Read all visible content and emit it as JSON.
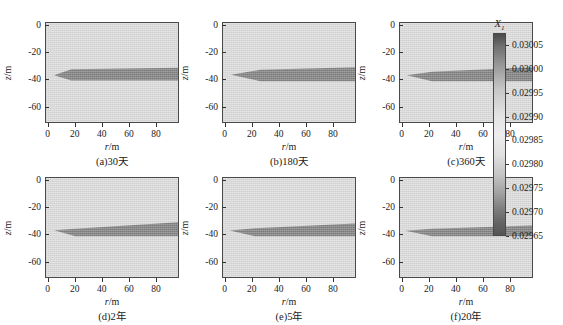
{
  "figure": {
    "background": "#ffffff",
    "panel_fill_color": "#dcdcdc",
    "plume_color": "#808080",
    "axis_color": "#4a4a4a"
  },
  "axes": {
    "x_title_var": "r",
    "x_title_unit": "/m",
    "y_title_var": "z",
    "y_title_unit": "/m",
    "x_ticks": [
      "0",
      "20",
      "40",
      "60",
      "80"
    ],
    "x_tick_values": [
      0,
      20,
      40,
      60,
      80
    ],
    "x_range": [
      -2,
      97
    ],
    "y_ticks": [
      "0",
      "-20",
      "-40",
      "-60"
    ],
    "y_tick_values": [
      0,
      -20,
      -40,
      -60
    ],
    "y_range": [
      -72,
      2
    ]
  },
  "colorbar": {
    "title_var": "X",
    "title_sub": "1",
    "labels": [
      "0.03005",
      "0.03000",
      "0.02995",
      "0.02990",
      "0.02985",
      "0.02980",
      "0.02975",
      "0.02970",
      "0.02965"
    ],
    "values": [
      0.03005,
      0.03,
      0.02995,
      0.0299,
      0.02985,
      0.0298,
      0.02975,
      0.0297,
      0.02965
    ],
    "vmin": 0.02965,
    "vmax": 0.030075,
    "orientation": "vertical"
  },
  "chart_data": {
    "type": "heatmap",
    "title": "",
    "xlabel": "r/m",
    "ylabel": "z/m",
    "colorbar_label": "X1",
    "xlim": [
      -2,
      97
    ],
    "ylim": [
      -72,
      2
    ],
    "grid": false,
    "legend": "colorbar-right",
    "panels": [
      {
        "id": "a",
        "caption": "(a)30天",
        "time_label": "30天",
        "row": 0,
        "col": 0,
        "plume_top_r0": -35.5,
        "plume_bottom_r0": -38.5,
        "plume_top_rmax": -31.5,
        "plume_bottom_rmax": -41.0,
        "nose_r": 4,
        "shoulder_r": 17,
        "shoulder_top": -32.5,
        "shoulder_bottom": -41.0,
        "description": "blunt-nosed slab, nearly constant thickness beyond r=20"
      },
      {
        "id": "b",
        "caption": "(b)180天",
        "time_label": "180天",
        "row": 0,
        "col": 1,
        "plume_top_r0": -35.5,
        "plume_bottom_r0": -38.0,
        "plume_top_rmax": -31.0,
        "plume_bottom_rmax": -41.5,
        "nose_r": 4,
        "shoulder_r": 26,
        "shoulder_top": -33.0,
        "shoulder_bottom": -41.5,
        "description": "tapered wedge thickening to r=26 then flat slab"
      },
      {
        "id": "c",
        "caption": "(c)360天",
        "time_label": "360天",
        "row": 0,
        "col": 2,
        "plume_top_r0": -36.0,
        "plume_bottom_r0": -38.0,
        "plume_top_rmax": -31.0,
        "plume_bottom_rmax": -41.5,
        "nose_r": 3,
        "shoulder_r": 22,
        "shoulder_top": -34.5,
        "shoulder_bottom": -41.5,
        "description": "thin wedge with sloping upper boundary rising to -31 at r=95"
      },
      {
        "id": "d",
        "caption": "(d)2年",
        "time_label": "2年",
        "row": 1,
        "col": 0,
        "plume_top_r0": -36.0,
        "plume_bottom_r0": -38.0,
        "plume_top_rmax": -31.0,
        "plume_bottom_rmax": -41.5,
        "nose_r": 4,
        "shoulder_r": 20,
        "shoulder_top": -36.0,
        "shoulder_bottom": -41.5,
        "description": "long inclined wedge, upper surface climbs steadily to -31"
      },
      {
        "id": "e",
        "caption": "(e)5年",
        "time_label": "5年",
        "row": 1,
        "col": 1,
        "plume_top_r0": -36.5,
        "plume_bottom_r0": -38.0,
        "plume_top_rmax": -32.0,
        "plume_bottom_rmax": -41.5,
        "nose_r": 3,
        "shoulder_r": 22,
        "shoulder_top": -35.5,
        "shoulder_bottom": -41.5,
        "description": "wedge with faint light lobe near the nose above the dark body"
      },
      {
        "id": "f",
        "caption": "(f)20年",
        "time_label": "20年",
        "row": 1,
        "col": 2,
        "plume_top_r0": -37.0,
        "plume_bottom_r0": -38.0,
        "plume_top_rmax": -33.5,
        "plume_bottom_rmax": -41.5,
        "nose_r": 2,
        "shoulder_r": 22,
        "shoulder_top": -36.0,
        "shoulder_bottom": -41.5,
        "description": "sharp thin spike at nose opening into a flat slab"
      }
    ]
  }
}
